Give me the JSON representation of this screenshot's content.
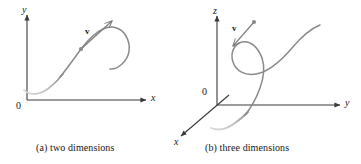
{
  "figure": {
    "background_color": "#ffffff",
    "ink_color": "#3a3a3a",
    "curve_color": "#8a8a8a",
    "curve_fade_color": "#c9c9c9",
    "text_color": "#1a1a1a",
    "panels": [
      {
        "id": "panel-a",
        "caption": "(a)  two dimensions",
        "caption_index": "(a)",
        "caption_text": "two dimensions",
        "origin_label": "0",
        "vector_label": "v",
        "axes": [
          {
            "name": "y-axis",
            "label": "y",
            "orientation": "vertical"
          },
          {
            "name": "x-axis",
            "label": "x",
            "orientation": "horizontal"
          }
        ]
      },
      {
        "id": "panel-b",
        "caption": "(b)  three dimensions",
        "caption_index": "(b)",
        "caption_text": "three dimensions",
        "origin_label": "0",
        "vector_label": "v",
        "axes": [
          {
            "name": "z-axis",
            "label": "z",
            "orientation": "vertical"
          },
          {
            "name": "y-axis",
            "label": "y",
            "orientation": "horizontal"
          },
          {
            "name": "x-axis",
            "label": "x",
            "orientation": "diagonal-down-left"
          }
        ]
      }
    ]
  }
}
